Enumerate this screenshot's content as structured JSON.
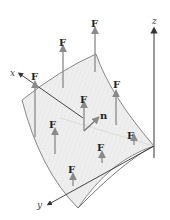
{
  "figure": {
    "colors": {
      "surface_fill": "#ececec",
      "surface_edge": "#777777",
      "arrow": "#8a8a8a",
      "axis": "#333333",
      "label": "#222222"
    }
  },
  "axes": {
    "x": {
      "label": "x"
    },
    "y": {
      "label": "y"
    },
    "z": {
      "label": "z"
    }
  },
  "normal": {
    "label": "n"
  },
  "field_vectors": [
    {
      "label": "F"
    },
    {
      "label": "F"
    },
    {
      "label": "F"
    },
    {
      "label": "F"
    },
    {
      "label": "F"
    },
    {
      "label": "F"
    },
    {
      "label": "F"
    },
    {
      "label": "F"
    },
    {
      "label": "F"
    }
  ]
}
